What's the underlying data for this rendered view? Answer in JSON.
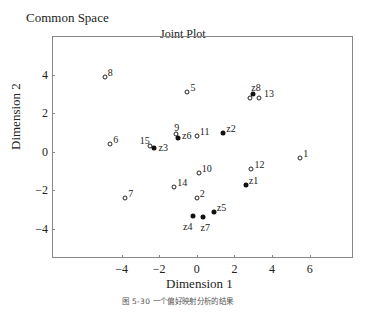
{
  "header": {
    "space_title": "Common Space"
  },
  "caption": "图 5-30 一个偏好映射分析的结果",
  "chart_data": {
    "type": "scatter",
    "title": "Joint Plot",
    "xlabel": "Dimension 1",
    "ylabel": "Dimension 2",
    "xlim": [
      -7.7,
      8.3
    ],
    "ylim": [
      -5.5,
      6.0
    ],
    "xticks": [
      -4,
      -2,
      0,
      2,
      4,
      6
    ],
    "yticks": [
      4,
      2,
      0,
      -2,
      -4
    ],
    "grid": false,
    "legend": "none",
    "series": [
      {
        "name": "objects",
        "marker": "open-circle",
        "points": [
          {
            "label": "1",
            "x": 5.5,
            "y": -0.3
          },
          {
            "label": "2",
            "x": 0.0,
            "y": -2.4
          },
          {
            "label": "5",
            "x": -0.5,
            "y": 3.1
          },
          {
            "label": "6",
            "x": -4.6,
            "y": 0.4
          },
          {
            "label": "7",
            "x": -3.8,
            "y": -2.4
          },
          {
            "label": "8",
            "x": -4.9,
            "y": 3.9
          },
          {
            "label": "9",
            "x": -1.1,
            "y": 0.9
          },
          {
            "label": "10",
            "x": 0.1,
            "y": -1.1
          },
          {
            "label": "11",
            "x": 0.0,
            "y": 0.8
          },
          {
            "label": "12",
            "x": 2.9,
            "y": -0.9
          },
          {
            "label": "",
            "x": 2.8,
            "y": 2.8
          },
          {
            "label": "13",
            "x": 3.3,
            "y": 2.8
          },
          {
            "label": "14",
            "x": -1.2,
            "y": -1.8
          },
          {
            "label": "15",
            "x": -2.5,
            "y": 0.3
          }
        ]
      },
      {
        "name": "subjects",
        "marker": "filled-circle",
        "points": [
          {
            "label": "z1",
            "x": 2.6,
            "y": -1.7
          },
          {
            "label": "z2",
            "x": 1.4,
            "y": 1.0
          },
          {
            "label": "z3",
            "x": -2.3,
            "y": 0.2
          },
          {
            "label": "z4",
            "x": -0.2,
            "y": -3.3
          },
          {
            "label": "z5",
            "x": 0.9,
            "y": -3.1
          },
          {
            "label": "z6",
            "x": -1.0,
            "y": 0.7
          },
          {
            "label": "z7",
            "x": 0.3,
            "y": -3.4
          },
          {
            "label": "z8",
            "x": 3.0,
            "y": 3.0
          }
        ]
      }
    ]
  }
}
